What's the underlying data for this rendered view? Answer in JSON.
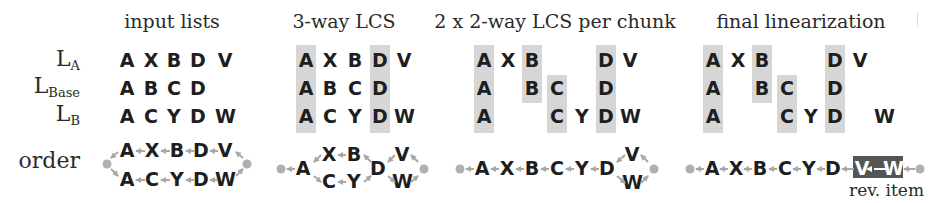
{
  "headers": {
    "input_lists": "input lists",
    "three_way": "3-way LCS",
    "two_way": "2 x 2-way LCS per chunk",
    "final": "final linearization"
  },
  "row_labels": {
    "la": {
      "base": "L",
      "sub": "A"
    },
    "lbase": {
      "base": "L",
      "sub": "Base"
    },
    "lb": {
      "base": "L",
      "sub": "B"
    },
    "order": "order"
  },
  "panels": {
    "input_lists": {
      "la": [
        "A",
        "X",
        "B",
        "D",
        "V"
      ],
      "lbase": [
        "A",
        "B",
        "C",
        "D"
      ],
      "lb": [
        "A",
        "C",
        "Y",
        "D",
        "W"
      ],
      "order_top": [
        "A",
        "X",
        "B",
        "D",
        "V"
      ],
      "order_bottom": [
        "A",
        "C",
        "Y",
        "D",
        "W"
      ]
    },
    "three_way": {
      "la": [
        "A",
        "X",
        "B",
        "D",
        "V"
      ],
      "lbase": [
        "A",
        "B",
        "C",
        "D"
      ],
      "lb": [
        "A",
        "C",
        "Y",
        "D",
        "W"
      ],
      "highlighted_columns": [
        "A",
        "D"
      ],
      "order": {
        "start": "A",
        "top": [
          "X",
          "B"
        ],
        "bottom": [
          "C",
          "Y"
        ],
        "merge": "D",
        "end_top": "V",
        "end_bottom": "W"
      }
    },
    "two_way": {
      "la": [
        "A",
        "X",
        "B",
        "D",
        "V"
      ],
      "lbase": [
        "A",
        "B",
        "C",
        "D"
      ],
      "lb": [
        "A",
        "C",
        "Y",
        "D",
        "W"
      ],
      "highlighted_columns": [
        "A",
        "B",
        "C",
        "D"
      ],
      "order": {
        "chain": [
          "A",
          "X",
          "B",
          "C",
          "Y",
          "D"
        ],
        "end_top": "V",
        "end_bottom": "W"
      }
    },
    "final": {
      "la": [
        "A",
        "X",
        "B",
        "D",
        "V"
      ],
      "lbase": [
        "A",
        "B",
        "C",
        "D"
      ],
      "lb": [
        "A",
        "C",
        "Y",
        "D",
        "W"
      ],
      "highlighted_columns": [
        "A",
        "B",
        "C",
        "D"
      ],
      "order": {
        "chain": [
          "A",
          "X",
          "B",
          "C",
          "Y",
          "D",
          "V",
          "W"
        ],
        "reversed_item": [
          "V",
          "W"
        ]
      },
      "annotation": "rev. item"
    }
  },
  "colors": {
    "highlight": "#d6d6d6",
    "reversed_item": "#555555",
    "arrow": "#a8a8a8",
    "node_dot": "#b0b0b0",
    "text": "#1e1e1e"
  }
}
